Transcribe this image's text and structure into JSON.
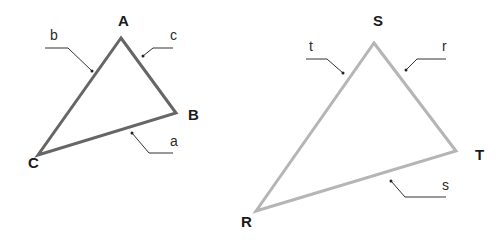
{
  "diagram": {
    "triangles": [
      {
        "name": "ABC",
        "stroke_color": "#666666",
        "stroke_width": 3,
        "vertices": [
          {
            "label": "A",
            "x": 121,
            "y": 38,
            "label_x": 118,
            "label_y": 26
          },
          {
            "label": "B",
            "x": 176,
            "y": 113,
            "label_x": 188,
            "label_y": 120
          },
          {
            "label": "C",
            "x": 38,
            "y": 155,
            "label_x": 28,
            "label_y": 168
          }
        ],
        "sides": [
          {
            "label": "b",
            "opposite": "B",
            "leader": "45,48 68,48 92,71",
            "dot_x": 92,
            "dot_y": 71,
            "label_x": 50,
            "label_y": 40
          },
          {
            "label": "c",
            "opposite": "C",
            "leader": "173,48 153,48 143,56",
            "dot_x": 143,
            "dot_y": 56,
            "label_x": 170,
            "label_y": 40
          },
          {
            "label": "a",
            "opposite": "A",
            "leader": "173,153 149,153 132,133",
            "dot_x": 132,
            "dot_y": 133,
            "label_x": 170,
            "label_y": 146
          }
        ]
      },
      {
        "name": "RST",
        "stroke_color": "#b5b5b5",
        "stroke_width": 3,
        "vertices": [
          {
            "label": "S",
            "x": 374,
            "y": 43,
            "label_x": 373,
            "label_y": 26
          },
          {
            "label": "T",
            "x": 456,
            "y": 151,
            "label_x": 475,
            "label_y": 160
          },
          {
            "label": "R",
            "x": 256,
            "y": 211,
            "label_x": 241,
            "label_y": 227
          }
        ],
        "sides": [
          {
            "label": "t",
            "opposite": "T",
            "leader": "306,59 327,59 343,73",
            "dot_x": 343,
            "dot_y": 73,
            "label_x": 309,
            "label_y": 51
          },
          {
            "label": "r",
            "opposite": "R",
            "leader": "446,59 417,59 406,70",
            "dot_x": 406,
            "dot_y": 70,
            "label_x": 442,
            "label_y": 51
          },
          {
            "label": "s",
            "opposite": "S",
            "leader": "446,197 405,197 391,181",
            "dot_x": 391,
            "dot_y": 181,
            "label_x": 442,
            "label_y": 190
          }
        ]
      }
    ]
  }
}
